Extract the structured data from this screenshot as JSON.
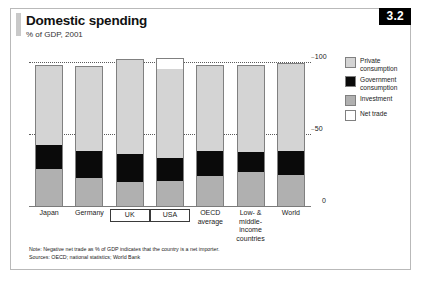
{
  "figure": {
    "badge": "3.2",
    "title": "Domestic spending",
    "subtitle": "% of GDP, 2001"
  },
  "legend": {
    "position": "right",
    "items": [
      {
        "label": "Private\nconsumption",
        "label_line1": "Private",
        "label_line2": "consumption",
        "color": "#d4d4d4",
        "key": "private"
      },
      {
        "label": "Government\nconsumption",
        "label_line1": "Government",
        "label_line2": "consumption",
        "color": "#0a0a0a",
        "key": "government"
      },
      {
        "label": "Investment",
        "label_line1": "Investment",
        "label_line2": "",
        "color": "#b0b0b0",
        "key": "investment"
      },
      {
        "label": "Net trade",
        "label_line1": "Net trade",
        "label_line2": "",
        "color": "#ffffff",
        "key": "nettrade"
      }
    ]
  },
  "axis": {
    "ticks": [
      {
        "value": 100,
        "label": "100"
      },
      {
        "value": 50,
        "label": "50"
      },
      {
        "value": 0,
        "label": "0"
      }
    ]
  },
  "footnotes": [
    "Note: Negative net trade as % of GDP indicates that the country is a net importer.",
    "Sources: OECD; national statistics; World Bank"
  ],
  "chart_data": {
    "type": "bar",
    "subtype": "stacked-bar",
    "title": "Domestic spending",
    "subtitle": "% of GDP, 2001",
    "xlabel": "",
    "ylabel": "% of GDP",
    "ylim": [
      0,
      110
    ],
    "yticks": [
      0,
      50,
      100
    ],
    "grid": "dotted horizontal at 50 and 100",
    "legend_position": "right",
    "categories": [
      "Japan",
      "Germany",
      "UK",
      "USA",
      "OECD average",
      "Low- & middle-income countries",
      "World"
    ],
    "category_labels": [
      {
        "lines": [
          "Japan"
        ],
        "boxed": false
      },
      {
        "lines": [
          "Germany"
        ],
        "boxed": false
      },
      {
        "lines": [
          "UK"
        ],
        "boxed": true
      },
      {
        "lines": [
          "USA"
        ],
        "boxed": true
      },
      {
        "lines": [
          "OECD",
          "average"
        ],
        "boxed": false
      },
      {
        "lines": [
          "Low- &",
          "middle-income",
          "countries"
        ],
        "boxed": false
      },
      {
        "lines": [
          "World"
        ],
        "boxed": false
      }
    ],
    "series": [
      {
        "name": "Investment",
        "color": "#b0b0b0",
        "values": [
          26,
          20,
          17,
          18,
          21,
          24,
          22
        ]
      },
      {
        "name": "Government consumption",
        "color": "#0a0a0a",
        "values": [
          17,
          19,
          20,
          16,
          18,
          14,
          17
        ]
      },
      {
        "name": "Private consumption",
        "color": "#d4d4d4",
        "values": [
          56,
          59,
          66,
          63,
          60,
          61,
          61
        ]
      },
      {
        "name": "Net trade",
        "color": "#ffffff",
        "values": [
          0,
          0,
          0,
          7,
          0,
          0,
          0
        ]
      }
    ],
    "totals": [
      99,
      98,
      103,
      104,
      99,
      99,
      100
    ]
  }
}
